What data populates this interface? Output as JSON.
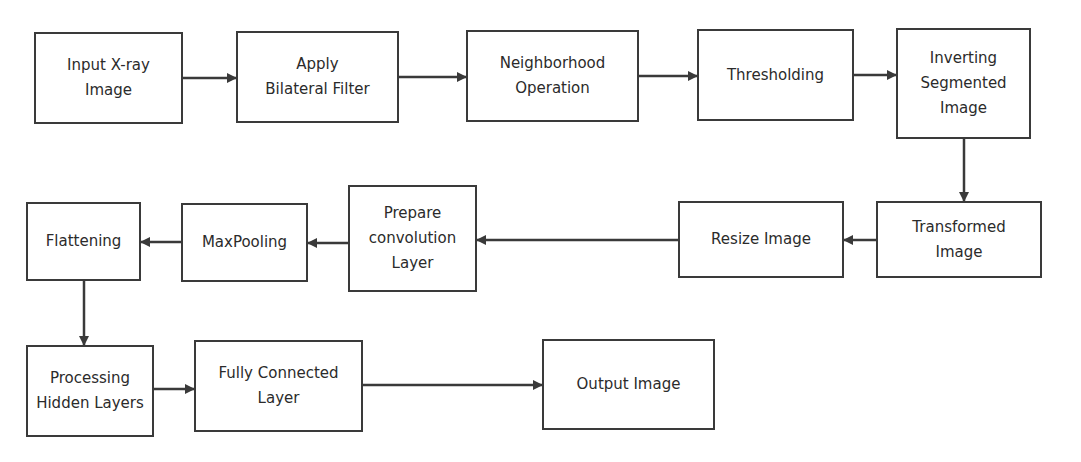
{
  "diagram": {
    "type": "flowchart",
    "nodes": [
      {
        "id": "input",
        "label": "Input X-ray\nImage",
        "x": 34,
        "y": 32,
        "w": 149,
        "h": 92
      },
      {
        "id": "bilateral",
        "label": "Apply\nBilateral Filter",
        "x": 236,
        "y": 31,
        "w": 163,
        "h": 92
      },
      {
        "id": "neighborhood",
        "label": "Neighborhood\nOperation",
        "x": 466,
        "y": 30,
        "w": 173,
        "h": 92
      },
      {
        "id": "thresholding",
        "label": "Thresholding",
        "x": 697,
        "y": 29,
        "w": 157,
        "h": 92
      },
      {
        "id": "inverting",
        "label": "Inverting\nSegmented\nImage",
        "x": 896,
        "y": 28,
        "w": 135,
        "h": 111
      },
      {
        "id": "transformed",
        "label": "Transformed\nImage",
        "x": 876,
        "y": 201,
        "w": 166,
        "h": 77
      },
      {
        "id": "resize",
        "label": "Resize Image",
        "x": 678,
        "y": 201,
        "w": 166,
        "h": 77
      },
      {
        "id": "prepare",
        "label": "Prepare\nconvolution\nLayer",
        "x": 348,
        "y": 185,
        "w": 129,
        "h": 107
      },
      {
        "id": "maxpooling",
        "label": "MaxPooling",
        "x": 181,
        "y": 203,
        "w": 127,
        "h": 79
      },
      {
        "id": "flattening",
        "label": "Flattening",
        "x": 26,
        "y": 202,
        "w": 115,
        "h": 79
      },
      {
        "id": "hidden",
        "label": "Processing\nHidden Layers",
        "x": 26,
        "y": 345,
        "w": 128,
        "h": 92
      },
      {
        "id": "fully",
        "label": "Fully Connected\nLayer",
        "x": 194,
        "y": 340,
        "w": 169,
        "h": 92
      },
      {
        "id": "output",
        "label": "Output Image",
        "x": 542,
        "y": 339,
        "w": 173,
        "h": 91
      }
    ],
    "edges": [
      {
        "from": "input",
        "to": "bilateral"
      },
      {
        "from": "bilateral",
        "to": "neighborhood"
      },
      {
        "from": "neighborhood",
        "to": "thresholding"
      },
      {
        "from": "thresholding",
        "to": "inverting"
      },
      {
        "from": "inverting",
        "to": "transformed"
      },
      {
        "from": "transformed",
        "to": "resize"
      },
      {
        "from": "resize",
        "to": "prepare"
      },
      {
        "from": "prepare",
        "to": "maxpooling"
      },
      {
        "from": "maxpooling",
        "to": "flattening"
      },
      {
        "from": "flattening",
        "to": "hidden"
      },
      {
        "from": "hidden",
        "to": "fully"
      },
      {
        "from": "fully",
        "to": "output"
      }
    ],
    "colors": {
      "stroke": "#3a3a3a",
      "text": "#2b2b2b",
      "background": "#ffffff"
    }
  }
}
